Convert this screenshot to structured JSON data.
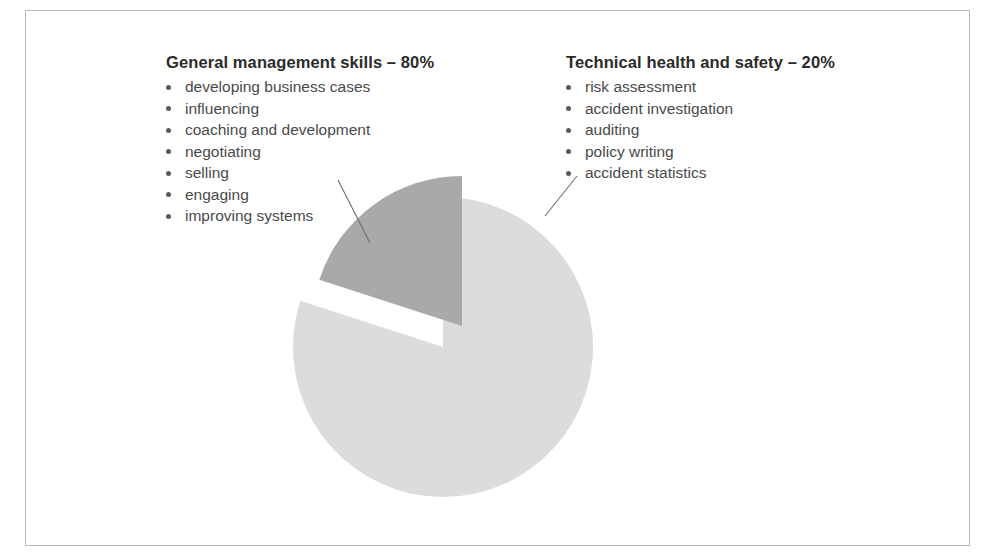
{
  "figure": {
    "name": "competency-split-pie",
    "background_color": "#ffffff",
    "frame_color": "#b9b9b9"
  },
  "legend": {
    "left": {
      "heading": "General management skills – 80%",
      "items": [
        "developing business cases",
        "influencing",
        "coaching and development",
        "negotiating",
        "selling",
        "engaging",
        "improving systems"
      ]
    },
    "right": {
      "heading": "Technical health and safety – 20%",
      "items": [
        "risk assessment",
        "accident investigation",
        "auditing",
        "policy writing",
        "accident statistics"
      ]
    }
  },
  "chart_data": {
    "type": "pie",
    "title": "",
    "subtitle": "",
    "xlabel": "",
    "ylabel": "",
    "grid": false,
    "legend_position": "callout-labels-above",
    "total": 100,
    "units": "%",
    "exploded_slice": "Technical health and safety",
    "start_angle_deg": -90,
    "direction": "clockwise",
    "labels": [
      "General management skills",
      "Technical health and safety"
    ],
    "values": [
      80,
      20
    ],
    "slices": [
      {
        "label": "General management skills",
        "value": 80,
        "percent": "80%",
        "color": "#dcdcdc",
        "exploded": false,
        "sweep_deg": 288,
        "callout_label": "General management skills – 80%"
      },
      {
        "label": "Technical health and safety",
        "value": 20,
        "percent": "20%",
        "color": "#a9a9a9",
        "exploded": true,
        "sweep_deg": 72,
        "callout_label": "Technical health and safety – 20%"
      }
    ],
    "colors": [
      "#dcdcdc",
      "#a9a9a9"
    ],
    "geometry": {
      "center_x": 443,
      "center_y": 347,
      "radius": 150,
      "explode_offset_x": 19,
      "explode_offset_y": -21
    },
    "leader_lines": [
      {
        "for": "General management skills",
        "from_x": 338,
        "from_y": 180,
        "to_x": 370,
        "to_y": 243,
        "color": "#6e6e6e"
      },
      {
        "for": "Technical health and safety",
        "from_x": 577,
        "from_y": 176,
        "to_x": 545,
        "to_y": 216,
        "color": "#6e6e6e"
      }
    ]
  }
}
